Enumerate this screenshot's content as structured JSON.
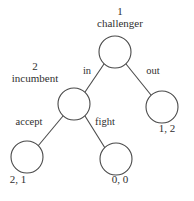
{
  "diagram": {
    "stroke_color": "#4a4a4a",
    "node_fill": "#ffffff",
    "text_color": "#2f2f2f",
    "nodes": [
      {
        "id": "root",
        "player_number": "1",
        "player_name": "challenger",
        "cx": 115,
        "cy": 52,
        "r": 16
      },
      {
        "id": "incumbent",
        "player_number": "2",
        "player_name": "incumbent",
        "cx": 74,
        "cy": 104,
        "r": 16
      }
    ],
    "terminals": [
      {
        "id": "terminal-out",
        "payoff": "1, 2",
        "cx": 162,
        "cy": 107,
        "r": 16
      },
      {
        "id": "terminal-accept",
        "payoff": "2, 1",
        "cx": 27,
        "cy": 157,
        "r": 16
      },
      {
        "id": "terminal-fight",
        "payoff": "0, 0",
        "cx": 116,
        "cy": 159,
        "r": 16
      }
    ],
    "edges": [
      {
        "id": "edge-in",
        "label": "in",
        "from": "root",
        "to": "incumbent"
      },
      {
        "id": "edge-out",
        "label": "out",
        "from": "root",
        "to": "terminal-out"
      },
      {
        "id": "edge-accept",
        "label": "accept",
        "from": "incumbent",
        "to": "terminal-accept"
      },
      {
        "id": "edge-fight",
        "label": "fight",
        "from": "incumbent",
        "to": "terminal-fight"
      }
    ]
  }
}
